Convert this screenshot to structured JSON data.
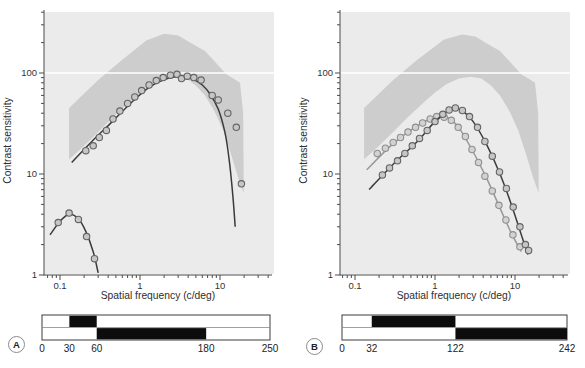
{
  "colors": {
    "figure_bg": "#ffffff",
    "plot_bg": "#ebebeb",
    "normal_band": "#cdcdcd",
    "gridline_100": "#ffffff",
    "axis": "#4a4a4a",
    "tick_text": "#333333",
    "curve_dark": "#3b3b3b",
    "curve_light": "#979797",
    "marker_fill": "#c6c6c6",
    "marker_stroke": "#646464",
    "marker_fill_light": "#d2d2d2",
    "marker_stroke_light": "#8f8f8f",
    "bar_black": "#0d0d0d",
    "bar_border": "#3c3c3c",
    "bar_divider": "#888888",
    "bar_fill": "#ffffff"
  },
  "chart_data": [
    {
      "panel": "A",
      "type": "scatter",
      "xlabel": "Spatial frequency (c/deg)",
      "ylabel": "Contrast sensitivity",
      "x_scale": "log",
      "y_scale": "log",
      "xlim": [
        0.065,
        42
      ],
      "ylim": [
        1,
        430
      ],
      "x_ticks": [
        0.1,
        1,
        10
      ],
      "y_ticks": [
        1,
        10,
        100
      ],
      "gridline_at_y": 100,
      "band": {
        "upper": [
          [
            0.13,
            45
          ],
          [
            0.3,
            85
          ],
          [
            0.6,
            135
          ],
          [
            1.2,
            210
          ],
          [
            2.0,
            245
          ],
          [
            3.0,
            235
          ],
          [
            4.5,
            195
          ],
          [
            6.5,
            165
          ],
          [
            9,
            125
          ],
          [
            12,
            97
          ],
          [
            15,
            87
          ],
          [
            17.8,
            80
          ],
          [
            19.5,
            40
          ],
          [
            19.8,
            7
          ]
        ],
        "lower": [
          [
            0.13,
            14
          ],
          [
            0.2,
            19
          ],
          [
            0.3,
            26
          ],
          [
            0.45,
            36
          ],
          [
            0.7,
            50
          ],
          [
            1.0,
            64
          ],
          [
            1.4,
            78
          ],
          [
            2.0,
            88
          ],
          [
            2.8,
            92
          ],
          [
            3.8,
            88
          ],
          [
            5,
            75
          ],
          [
            6.5,
            60
          ],
          [
            8.5,
            42
          ],
          [
            11,
            27
          ],
          [
            14,
            15
          ],
          [
            17,
            9
          ],
          [
            19.8,
            6.5
          ]
        ]
      },
      "series": [
        {
          "name": "main-csf",
          "color": "dark",
          "points": [
            [
              0.21,
              17
            ],
            [
              0.26,
              19
            ],
            [
              0.31,
              23
            ],
            [
              0.38,
              27
            ],
            [
              0.46,
              35
            ],
            [
              0.56,
              42
            ],
            [
              0.7,
              50
            ],
            [
              0.86,
              58
            ],
            [
              1.05,
              67
            ],
            [
              1.3,
              76
            ],
            [
              1.6,
              84
            ],
            [
              1.95,
              90
            ],
            [
              2.4,
              95
            ],
            [
              2.9,
              97
            ],
            [
              3.3,
              88
            ],
            [
              3.9,
              93
            ],
            [
              4.7,
              90
            ],
            [
              5.8,
              85
            ],
            [
              8.0,
              60
            ],
            [
              9.5,
              54
            ],
            [
              12.5,
              40
            ],
            [
              16,
              29
            ],
            [
              18.5,
              8
            ]
          ],
          "curve": [
            [
              0.14,
              13
            ],
            [
              0.25,
              21
            ],
            [
              0.45,
              33
            ],
            [
              0.8,
              52
            ],
            [
              1.3,
              72
            ],
            [
              2.0,
              86
            ],
            [
              2.8,
              92
            ],
            [
              3.6,
              92
            ],
            [
              4.6,
              87
            ],
            [
              6.0,
              76
            ],
            [
              7.5,
              62
            ],
            [
              9.5,
              44
            ],
            [
              11.5,
              26
            ],
            [
              13,
              14
            ],
            [
              14.5,
              6
            ],
            [
              15.5,
              3
            ]
          ]
        },
        {
          "name": "low-csf",
          "color": "dark",
          "points": [
            [
              0.095,
              3.3
            ],
            [
              0.13,
              4.1
            ],
            [
              0.17,
              3.55
            ],
            [
              0.215,
              2.4
            ],
            [
              0.27,
              1.45
            ]
          ],
          "curve": [
            [
              0.075,
              2.5
            ],
            [
              0.1,
              3.4
            ],
            [
              0.13,
              4.0
            ],
            [
              0.17,
              3.6
            ],
            [
              0.21,
              2.7
            ],
            [
              0.26,
              1.7
            ],
            [
              0.3,
              1.05
            ]
          ]
        }
      ],
      "scale_bar": {
        "label": "A",
        "range": [
          0,
          250
        ],
        "values": [
          "0",
          "30",
          "60",
          "180",
          "250"
        ],
        "value_positions": [
          0,
          30,
          60,
          180,
          250
        ],
        "rows": [
          {
            "black_segments": [
              [
                30,
                60
              ]
            ]
          },
          {
            "black_segments": [
              [
                60,
                180
              ]
            ]
          }
        ]
      }
    },
    {
      "panel": "B",
      "type": "scatter",
      "xlabel": "Spatial frequency (c/deg)",
      "ylabel": "Contrast sensitivity",
      "x_scale": "log",
      "y_scale": "log",
      "xlim": [
        0.065,
        42
      ],
      "ylim": [
        1,
        430
      ],
      "x_ticks": [
        0.1,
        1,
        10
      ],
      "y_ticks": [
        1,
        10,
        100
      ],
      "gridline_at_y": 100,
      "band": {
        "upper": [
          [
            0.13,
            45
          ],
          [
            0.3,
            85
          ],
          [
            0.6,
            135
          ],
          [
            1.3,
            215
          ],
          [
            2.2,
            240
          ],
          [
            3.2,
            230
          ],
          [
            4.5,
            195
          ],
          [
            6.5,
            165
          ],
          [
            9,
            125
          ],
          [
            12,
            97
          ],
          [
            15,
            87
          ],
          [
            17.8,
            80
          ],
          [
            19.5,
            40
          ],
          [
            19.8,
            7
          ]
        ],
        "lower": [
          [
            0.13,
            14
          ],
          [
            0.2,
            19
          ],
          [
            0.3,
            26
          ],
          [
            0.45,
            36
          ],
          [
            0.7,
            50
          ],
          [
            1.0,
            64
          ],
          [
            1.4,
            78
          ],
          [
            2.0,
            88
          ],
          [
            2.8,
            92
          ],
          [
            3.8,
            88
          ],
          [
            5,
            75
          ],
          [
            6.5,
            60
          ],
          [
            8.5,
            42
          ],
          [
            11,
            27
          ],
          [
            14,
            15
          ],
          [
            17,
            9
          ],
          [
            19.8,
            6.5
          ]
        ]
      },
      "series": [
        {
          "name": "light-csf",
          "color": "light",
          "points": [
            [
              0.19,
              16
            ],
            [
              0.24,
              18
            ],
            [
              0.3,
              20.5
            ],
            [
              0.37,
              23
            ],
            [
              0.46,
              26
            ],
            [
              0.57,
              29
            ],
            [
              0.7,
              32
            ],
            [
              0.87,
              35
            ],
            [
              1.05,
              37
            ],
            [
              1.3,
              36.5
            ],
            [
              1.6,
              34
            ],
            [
              1.95,
              29
            ],
            [
              2.4,
              23.5
            ],
            [
              2.9,
              17.5
            ],
            [
              3.5,
              13
            ],
            [
              4.2,
              9.5
            ],
            [
              5.2,
              6.8
            ],
            [
              6.3,
              4.9
            ],
            [
              7.7,
              3.5
            ],
            [
              9.4,
              2.5
            ],
            [
              11.5,
              1.9
            ]
          ],
          "curve": [
            [
              0.14,
              11
            ],
            [
              0.3,
              20
            ],
            [
              0.6,
              30
            ],
            [
              1.0,
              36.5
            ],
            [
              1.4,
              36.5
            ],
            [
              2.0,
              28.5
            ],
            [
              3.0,
              16.5
            ],
            [
              4.5,
              8.8
            ],
            [
              6.5,
              4.6
            ],
            [
              9,
              2.6
            ],
            [
              12,
              1.7
            ]
          ]
        },
        {
          "name": "dark-csf",
          "color": "dark",
          "points": [
            [
              0.22,
              9.8
            ],
            [
              0.27,
              11.5
            ],
            [
              0.34,
              13.5
            ],
            [
              0.42,
              16
            ],
            [
              0.52,
              19
            ],
            [
              0.64,
              22.5
            ],
            [
              0.8,
              27
            ],
            [
              1.0,
              33
            ],
            [
              1.25,
              39
            ],
            [
              1.5,
              43
            ],
            [
              1.8,
              45
            ],
            [
              2.2,
              42.5
            ],
            [
              2.7,
              37
            ],
            [
              3.4,
              29
            ],
            [
              4.2,
              21
            ],
            [
              5.2,
              15
            ],
            [
              6.4,
              10.5
            ],
            [
              7.8,
              7.2
            ],
            [
              9.5,
              4.7
            ],
            [
              11.5,
              3.0
            ],
            [
              13.5,
              2.0
            ],
            [
              14.8,
              1.75
            ]
          ],
          "curve": [
            [
              0.15,
              7
            ],
            [
              0.3,
              12.5
            ],
            [
              0.6,
              21
            ],
            [
              1.0,
              33
            ],
            [
              1.6,
              44
            ],
            [
              2.1,
              43
            ],
            [
              3.0,
              33
            ],
            [
              4.5,
              19
            ],
            [
              6.5,
              10
            ],
            [
              9,
              5
            ],
            [
              12,
              2.5
            ],
            [
              14.5,
              1.6
            ]
          ]
        }
      ],
      "scale_bar": {
        "label": "B",
        "range": [
          0,
          242
        ],
        "values": [
          "0",
          "32",
          "122",
          "242"
        ],
        "value_positions": [
          0,
          32,
          122,
          242
        ],
        "rows": [
          {
            "black_segments": [
              [
                32,
                122
              ]
            ]
          },
          {
            "black_segments": [
              [
                122,
                242
              ]
            ]
          }
        ]
      }
    }
  ]
}
